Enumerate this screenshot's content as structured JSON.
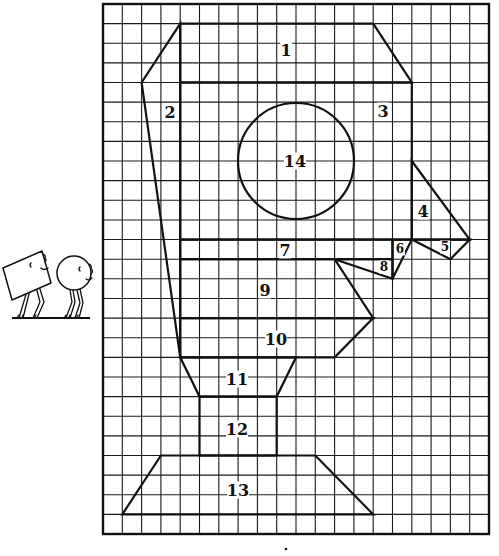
{
  "worksheet": {
    "grid": {
      "left": 103,
      "top": 4,
      "columns": 20,
      "rows": 27,
      "cell_width": 19.3,
      "cell_height": 19.63,
      "line_color": "#1a1a1a"
    },
    "pieces": [
      {
        "id": "1",
        "label": "1",
        "label_pos": [
          286,
          50
        ]
      },
      {
        "id": "2",
        "label": "2",
        "label_pos": [
          170,
          112
        ]
      },
      {
        "id": "3",
        "label": "3",
        "label_pos": [
          383,
          111
        ]
      },
      {
        "id": "4",
        "label": "4",
        "label_pos": [
          423,
          211
        ]
      },
      {
        "id": "5",
        "label": "5",
        "label_pos": [
          445,
          247
        ],
        "small": true
      },
      {
        "id": "6",
        "label": "6",
        "label_pos": [
          400,
          249
        ],
        "small": true
      },
      {
        "id": "7",
        "label": "7",
        "label_pos": [
          285,
          250
        ]
      },
      {
        "id": "8",
        "label": "8",
        "label_pos": [
          384,
          267
        ],
        "small": true
      },
      {
        "id": "9",
        "label": "9",
        "label_pos": [
          265,
          290
        ]
      },
      {
        "id": "10",
        "label": "10",
        "label_pos": [
          276,
          339
        ]
      },
      {
        "id": "11",
        "label": "11",
        "label_pos": [
          237,
          379
        ]
      },
      {
        "id": "12",
        "label": "12",
        "label_pos": [
          237,
          429
        ]
      },
      {
        "id": "13",
        "label": "13",
        "label_pos": [
          238,
          490
        ]
      },
      {
        "id": "14",
        "label": "14",
        "label_pos": [
          295,
          161
        ]
      }
    ],
    "characters": [
      "square-character",
      "circle-character"
    ]
  }
}
